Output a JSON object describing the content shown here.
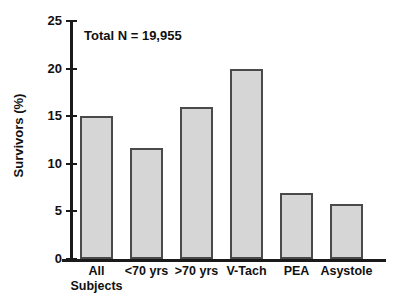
{
  "chart_data": {
    "type": "bar",
    "title": "",
    "annotation": "Total N = 19,955",
    "xlabel": "",
    "ylabel": "Survivors (%)",
    "ylim": [
      0,
      25
    ],
    "ytick_labels": [
      "0",
      "5",
      "10",
      "15",
      "20",
      "25"
    ],
    "ytick_values": [
      0,
      5,
      10,
      15,
      20,
      25
    ],
    "grid": false,
    "legend": null,
    "categories": [
      "All\nSubjects",
      "<70 yrs",
      ">70 yrs",
      "V-Tach",
      "PEA",
      "Asystole"
    ],
    "values": [
      15.0,
      11.7,
      16.0,
      20.0,
      6.9,
      5.8
    ],
    "bar_fill_color": "#d6d6d6",
    "bar_edge_color": "#4a4a4a",
    "axis_color": "#1a1a1a"
  }
}
